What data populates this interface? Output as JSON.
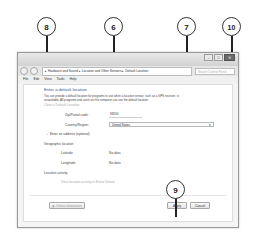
{
  "window": {
    "caption_buttons": {
      "minimize": "–",
      "maximize": "□",
      "close": "✕"
    },
    "breadcrumb": [
      "Hardware and Sound",
      "Location and Other Sensors",
      "Default Location"
    ],
    "breadcrumb_text": "▸ Hardware and Sound ▸ Location and Other Sensors ▸ Default Location",
    "search_placeholder": "Search Control Panel",
    "menu": [
      "File",
      "Edit",
      "View",
      "Tools",
      "Help"
    ]
  },
  "content": {
    "heading": "Enter a default location",
    "description_line1": "You can provide a default location for programs to use when a location sensor, such as a GPS receiver, is",
    "description_line2": "unavailable. All programs and users on this computer can use the default location.",
    "clear_link": "Clear a Default Location",
    "zip_label": "Zip/Postal code:",
    "zip_value": "98200",
    "country_label": "Country/Region:",
    "country_value": "United States",
    "address_toggle": "Enter an address (optional)",
    "geo_heading": "Geographic location",
    "latitude_label": "Latitude",
    "latitude_value": "No data",
    "longitude_label": "Longitude",
    "longitude_value": "No data",
    "activity_heading": "Location activity",
    "activity_link": "View location activity in Event Viewer",
    "privacy_link": "Online information",
    "apply_label": "Apply",
    "cancel_label": "Cancel"
  },
  "callouts": [
    "8",
    "6",
    "7",
    "10",
    "9"
  ]
}
